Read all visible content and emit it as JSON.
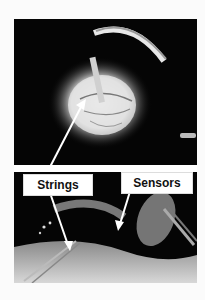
{
  "figure": {
    "labels": [
      {
        "text": "Strings"
      },
      {
        "text": "Sensors"
      }
    ],
    "colors": {
      "background": "#fbfbfb",
      "photo_bg": "#050505",
      "label_bg": "#ffffff",
      "arrow": "#ffffff"
    }
  }
}
